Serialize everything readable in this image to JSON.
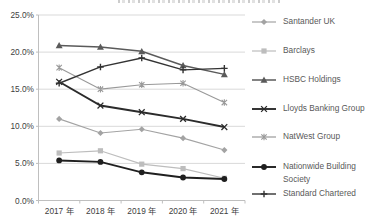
{
  "chart_data": {
    "type": "line",
    "categories": [
      "2017 年",
      "2018 年",
      "2019 年",
      "2020 年",
      "2021 年"
    ],
    "y_ticks": [
      "25.0%",
      "20.0%",
      "15.0%",
      "10.0%",
      "5.0%",
      "0.0%"
    ],
    "ylim": [
      0,
      25
    ],
    "unit": "%",
    "grid": true,
    "legend_position": "right",
    "colors": {
      "grid": "#d9d9d9",
      "axis": "#bfbfbf",
      "axis_label": "#404040",
      "legend_text": "#595959",
      "background": "#ffffff"
    },
    "series": [
      {
        "name": "Santander UK",
        "values": [
          11.0,
          9.1,
          9.6,
          8.4,
          6.8
        ],
        "marker": "diamond",
        "color": "#a3a3a3",
        "line_width": 1.2
      },
      {
        "name": "Barclays",
        "values": [
          6.4,
          6.7,
          4.9,
          4.3,
          3.0
        ],
        "marker": "square",
        "color": "#bdbdbd",
        "line_width": 1.2
      },
      {
        "name": "HSBC Holdings",
        "values": [
          20.9,
          20.7,
          20.1,
          18.2,
          17.0
        ],
        "marker": "triangle",
        "color": "#5a5a5a",
        "line_width": 1.5
      },
      {
        "name": "Lloyds Banking Group",
        "values": [
          16.0,
          12.8,
          11.9,
          11.0,
          9.9
        ],
        "marker": "x",
        "color": "#2b2b2b",
        "line_width": 1.9
      },
      {
        "name": "NatWest Group",
        "values": [
          17.9,
          15.0,
          15.6,
          15.8,
          13.2
        ],
        "marker": "asterisk",
        "color": "#999999",
        "line_width": 1.2
      },
      {
        "name": "Nationwide Building Society",
        "values": [
          5.4,
          5.2,
          3.8,
          3.1,
          2.9
        ],
        "marker": "circle",
        "color": "#1f1f1f",
        "line_width": 1.9
      },
      {
        "name": "Standard Chartered",
        "values": [
          15.8,
          18.0,
          19.2,
          17.6,
          17.8
        ],
        "marker": "plus",
        "color": "#333333",
        "line_width": 1.4
      }
    ]
  }
}
